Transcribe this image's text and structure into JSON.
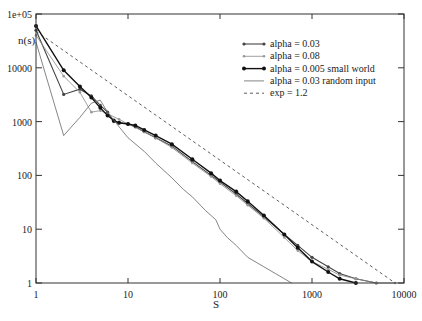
{
  "chart_data": {
    "type": "line",
    "title": "",
    "xlabel": "S",
    "ylabel": "n(s)",
    "xscale": "log",
    "yscale": "log",
    "xlim": [
      1,
      10000
    ],
    "ylim": [
      1,
      100000
    ],
    "grid": false,
    "legend_position": "upper right (inside)",
    "x_ticks": [
      "1",
      "10",
      "100",
      "1000",
      "10000"
    ],
    "y_ticks": [
      "1",
      "10",
      "100",
      "1000",
      "10000",
      "1e+05"
    ],
    "series": [
      {
        "name": "alpha = 0.03",
        "style": "line with small dot markers",
        "color": "#444444",
        "x": [
          1,
          2,
          3,
          4,
          5,
          6,
          7,
          8,
          10,
          12,
          15,
          20,
          30,
          50,
          80,
          100,
          150,
          200,
          300,
          500,
          700,
          1000,
          1500,
          2000,
          3000,
          5000
        ],
        "y": [
          50000,
          3200,
          4000,
          3000,
          2000,
          1500,
          1000,
          950,
          900,
          800,
          650,
          500,
          350,
          180,
          100,
          75,
          45,
          30,
          17,
          8,
          5,
          3,
          2,
          1.5,
          1.2,
          1
        ]
      },
      {
        "name": "alpha = 0.08",
        "style": "thin gray line with small markers",
        "color": "#888888",
        "x": [
          1,
          2,
          3,
          4,
          5,
          6,
          8,
          10,
          15,
          20,
          30,
          50,
          80,
          100,
          150,
          200,
          300,
          500,
          700,
          1000,
          1500,
          2000,
          3000,
          5000,
          8000
        ],
        "y": [
          40000,
          7000,
          3500,
          1500,
          1600,
          1400,
          1100,
          900,
          650,
          500,
          330,
          170,
          95,
          70,
          42,
          28,
          16,
          7,
          4,
          2.5,
          1.8,
          1.4,
          1.2,
          1,
          1
        ]
      },
      {
        "name": "alpha = 0.005 small world",
        "style": "thick black line with filled circle markers",
        "color": "#111111",
        "x": [
          1,
          2,
          3,
          4,
          5,
          6,
          7,
          8,
          10,
          12,
          15,
          20,
          30,
          50,
          80,
          100,
          150,
          200,
          300,
          500,
          700,
          1000,
          1500,
          2000,
          3000
        ],
        "y": [
          60000,
          9000,
          4500,
          2800,
          1800,
          1300,
          1050,
          950,
          900,
          850,
          700,
          550,
          380,
          200,
          110,
          80,
          50,
          33,
          18,
          8,
          4.5,
          2.5,
          1.6,
          1.2,
          1
        ]
      },
      {
        "name": "alpha = 0.03 random input",
        "style": "thin gray line, no markers",
        "color": "#666666",
        "x": [
          1,
          2,
          3,
          4,
          5,
          6,
          8,
          10,
          15,
          20,
          30,
          40,
          50,
          70,
          90,
          100,
          120,
          150,
          200,
          300,
          400,
          600
        ],
        "y": [
          30000,
          550,
          1200,
          2200,
          2500,
          1500,
          800,
          500,
          280,
          170,
          90,
          55,
          40,
          22,
          15,
          10,
          7,
          5,
          3,
          2,
          1.5,
          1
        ]
      },
      {
        "name": "exp = 1.2",
        "style": "dashed line",
        "color": "#333333",
        "x": [
          1,
          8000
        ],
        "y": [
          48000,
          1
        ]
      }
    ]
  },
  "axes": {
    "xlabel": "S",
    "ylabel": "n(s)"
  }
}
